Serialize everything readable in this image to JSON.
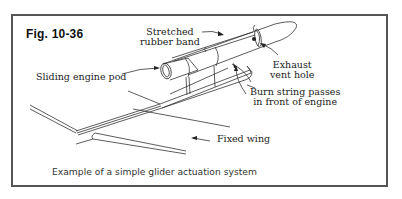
{
  "figure": {
    "title": "Fig. 10-36",
    "caption": "Example of a simple glider actuation system"
  },
  "labels": {
    "rubber_band": [
      "Stretched",
      "rubber band"
    ],
    "engine_pod": "Sliding engine pod",
    "exhaust": [
      "Exhaust",
      "vent hole"
    ],
    "burn_string": [
      "Burn string passes",
      "in front of engine"
    ],
    "fixed_wing": "Fixed wing"
  },
  "colors": {
    "line": "#333333",
    "border": "#555555",
    "background": "#ffffff"
  }
}
